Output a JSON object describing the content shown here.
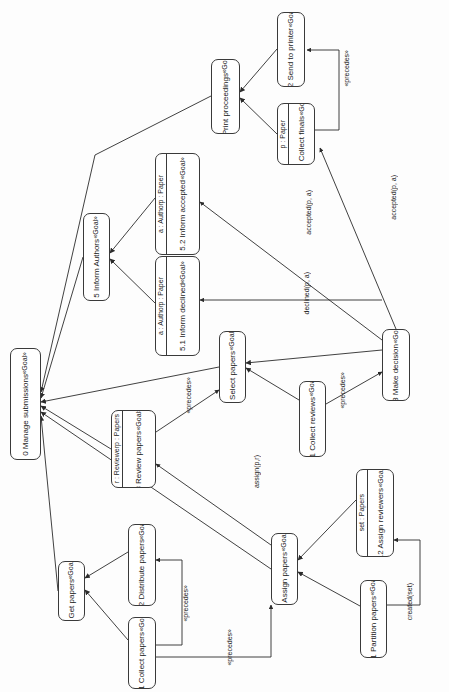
{
  "diagram": {
    "notation": "UML goal diagram (rotated 90 degrees)",
    "stereotype": "«Goal»",
    "precedes_label": "«precedes»",
    "stroke_color": "#3a3a3a",
    "background_color": "#fdfdfd",
    "nodes": [
      {
        "id": "g0",
        "stereotype": "«Goal»",
        "title": "0 Manage submissions",
        "attrs": [],
        "x": 10,
        "y": 348,
        "w": 31,
        "h": 112
      },
      {
        "id": "g5",
        "stereotype": "«Goal»",
        "title": "5 Inform Authors",
        "attrs": [],
        "x": 83,
        "y": 213,
        "w": 27,
        "h": 88
      },
      {
        "id": "g52",
        "stereotype": "«Goal»",
        "title": "5.2 Inform accepted",
        "attrs": [
          "p : Paper",
          "a : Author"
        ],
        "x": 155,
        "y": 153,
        "w": 45,
        "h": 102
      },
      {
        "id": "g51",
        "stereotype": "«Goal»",
        "title": "5.1 Inform declined",
        "attrs": [
          "p : Paper",
          "a : Author"
        ],
        "x": 155,
        "y": 256,
        "w": 45,
        "h": 100
      },
      {
        "id": "g6",
        "stereotype": "«Goal»",
        "title": "6 Print proceedings",
        "attrs": [],
        "x": 211,
        "y": 59,
        "w": 29,
        "h": 75
      },
      {
        "id": "g62",
        "stereotype": "«Goal»",
        "title": "6.2 Send to printer",
        "attrs": [],
        "x": 277,
        "y": 12,
        "w": 28,
        "h": 75
      },
      {
        "id": "g61",
        "stereotype": "«Goal»",
        "title": "6.1 Collect finals",
        "attrs": [
          "p : Paper"
        ],
        "x": 277,
        "y": 103,
        "w": 38,
        "h": 62
      },
      {
        "id": "g4",
        "stereotype": "«Goal»",
        "title": "4 Select papers",
        "attrs": [],
        "x": 219,
        "y": 331,
        "w": 27,
        "h": 72
      },
      {
        "id": "g41",
        "stereotype": "«Goal»",
        "title": "4.1 Collect reviews",
        "attrs": [],
        "x": 299,
        "y": 381,
        "w": 27,
        "h": 76
      },
      {
        "id": "g43",
        "stereotype": "«Goal»",
        "title": "4.3 Make decision",
        "attrs": [],
        "x": 382,
        "y": 329,
        "w": 28,
        "h": 72
      },
      {
        "id": "g3",
        "stereotype": "«Goal»",
        "title": "3 Review papers",
        "attrs": [
          "p : Papers",
          "r : Reviewer"
        ],
        "x": 111,
        "y": 410,
        "w": 45,
        "h": 78
      },
      {
        "id": "g2",
        "stereotype": "«Goal»",
        "title": "2 Assign papers",
        "attrs": [],
        "x": 271,
        "y": 533,
        "w": 27,
        "h": 72
      },
      {
        "id": "g22",
        "stereotype": "«Goal»",
        "title": "2.2 Assign reviewers",
        "attrs": [
          "set : Papers"
        ],
        "x": 356,
        "y": 469,
        "w": 38,
        "h": 88
      },
      {
        "id": "g21",
        "stereotype": "«Goal»",
        "title": "2.1 Partition papers",
        "attrs": [],
        "x": 360,
        "y": 580,
        "w": 27,
        "h": 78
      },
      {
        "id": "g1",
        "stereotype": "«Goal»",
        "title": "1 Get papers",
        "attrs": [],
        "x": 58,
        "y": 561,
        "w": 27,
        "h": 60
      },
      {
        "id": "g12",
        "stereotype": "«Goal»",
        "title": "1.2 Distribute papers",
        "attrs": [],
        "x": 128,
        "y": 524,
        "w": 28,
        "h": 82
      },
      {
        "id": "g11",
        "stereotype": "«Goal»",
        "title": "1.1 Collect papers",
        "attrs": [],
        "x": 128,
        "y": 617,
        "w": 28,
        "h": 72
      }
    ],
    "edge_labels": [
      {
        "id": "el1",
        "text": "«precedes»",
        "x": 343,
        "y": 50
      },
      {
        "id": "el2",
        "text": "accepted(p, a)",
        "x": 305,
        "y": 190
      },
      {
        "id": "el3",
        "text": "accepted(p, a)",
        "x": 390,
        "y": 175
      },
      {
        "id": "el4",
        "text": "declined(p, a)",
        "x": 303,
        "y": 272
      },
      {
        "id": "el5",
        "text": "«precedes»",
        "x": 185,
        "y": 377
      },
      {
        "id": "el6",
        "text": "«precedes»",
        "x": 339,
        "y": 372
      },
      {
        "id": "el7",
        "text": "assign(p,r)",
        "x": 253,
        "y": 455
      },
      {
        "id": "el8",
        "text": "created(set)",
        "x": 406,
        "y": 583
      },
      {
        "id": "el9",
        "text": "«precedes»",
        "x": 182,
        "y": 585
      },
      {
        "id": "el10",
        "text": "«precedes»",
        "x": 226,
        "y": 629
      }
    ]
  }
}
